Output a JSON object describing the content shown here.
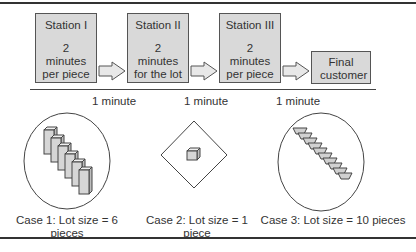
{
  "stations": [
    {
      "title": "Station I",
      "desc": "2 minutes per piece"
    },
    {
      "title": "Station II",
      "desc": "2 minutes for the lot"
    },
    {
      "title": "Station III",
      "desc": "2 minutes per piece"
    }
  ],
  "final": {
    "title": "Final customer"
  },
  "transfer_times": [
    "1 minute",
    "1 minute",
    "1 minute"
  ],
  "cases": [
    {
      "label": "Case 1: Lot size = 6 pieces",
      "pieces": 6,
      "shape": "ellipse"
    },
    {
      "label": "Case 2: Lot size = 1 piece",
      "pieces": 1,
      "shape": "diamond"
    },
    {
      "label": "Case 3: Lot size = 10 pieces",
      "pieces": 10,
      "shape": "ellipse"
    }
  ],
  "colors": {
    "box_fill": "#d9d9d9",
    "stroke": "#555555"
  }
}
